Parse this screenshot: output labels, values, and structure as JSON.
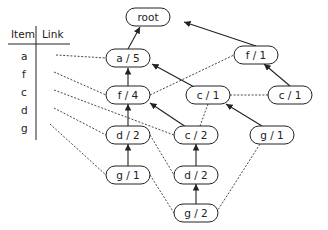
{
  "table": {
    "headers": [
      "Item",
      "Link"
    ],
    "items": [
      "a",
      "f",
      "c",
      "d",
      "g"
    ]
  },
  "nodes": {
    "root": "root",
    "a5": "a / 5",
    "f1": "f / 1",
    "f4": "f / 4",
    "c1a": "c / 1",
    "c1b": "c / 1",
    "d2a": "d / 2",
    "c2": "c / 2",
    "g1b": "g / 1",
    "g1a": "g / 1",
    "d2b": "d / 2",
    "g2": "g / 2"
  }
}
